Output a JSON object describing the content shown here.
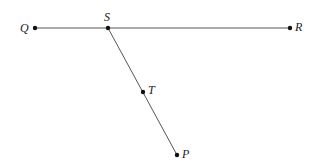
{
  "diagram": {
    "colors": {
      "line": "#555555",
      "point": "#111111",
      "label": "#222222"
    },
    "points": [
      {
        "name": "Q",
        "x": 35,
        "y": 28
      },
      {
        "name": "S",
        "x": 108,
        "y": 28
      },
      {
        "name": "R",
        "x": 290,
        "y": 28
      },
      {
        "name": "T",
        "x": 143,
        "y": 92
      },
      {
        "name": "P",
        "x": 177,
        "y": 155
      }
    ],
    "segments": [
      {
        "from": "Q",
        "to": "R"
      },
      {
        "from": "S",
        "to": "P"
      }
    ],
    "labels": {
      "Q": "Q",
      "S": "S",
      "R": "R",
      "T": "T",
      "P": "P"
    }
  }
}
